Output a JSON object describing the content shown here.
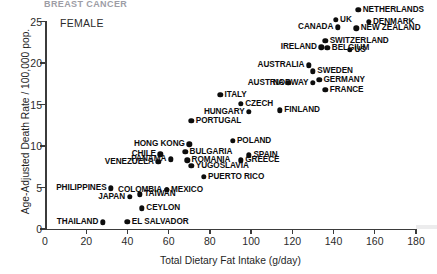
{
  "top_clipped_text": "BREAST CANCER",
  "annotation": "FEMALE",
  "chart_data": {
    "type": "scatter",
    "title": "",
    "xlabel": "Total Dietary Fat Intake (g/day)",
    "ylabel": "Age-Adjusted Death Rate / 100,000 pop.",
    "xlim": [
      0,
      180
    ],
    "ylim": [
      0,
      25
    ],
    "xticks": [
      0,
      20,
      40,
      60,
      80,
      100,
      120,
      140,
      160,
      180
    ],
    "yticks": [
      0,
      5,
      10,
      15,
      20,
      25
    ],
    "grid": false,
    "legend": "none",
    "marker_color": "#0d0d0d",
    "points": [
      {
        "label": "NETHERLANDS",
        "x": 152,
        "y": 26.4,
        "side": "r"
      },
      {
        "label": "UK",
        "x": 141,
        "y": 25.2,
        "side": "r"
      },
      {
        "label": "DENMARK",
        "x": 157,
        "y": 25.0,
        "side": "r"
      },
      {
        "label": "CANADA",
        "x": 142,
        "y": 24.3,
        "side": "l"
      },
      {
        "label": "NEW ZEALAND",
        "x": 151,
        "y": 24.2,
        "side": "r"
      },
      {
        "label": "SWITZERLAND",
        "x": 136,
        "y": 22.7,
        "side": "r"
      },
      {
        "label": "IRELAND",
        "x": 134,
        "y": 21.9,
        "side": "l"
      },
      {
        "label": "BELGIUM",
        "x": 137,
        "y": 21.8,
        "side": "r"
      },
      {
        "label": "US",
        "x": 148,
        "y": 21.6,
        "side": "r"
      },
      {
        "label": "AUSTRALIA",
        "x": 128,
        "y": 19.7,
        "side": "l"
      },
      {
        "label": "SWEDEN",
        "x": 130,
        "y": 19.0,
        "side": "r"
      },
      {
        "label": "GERMANY",
        "x": 133,
        "y": 18.0,
        "side": "r"
      },
      {
        "label": "AUSTRIA",
        "x": 118,
        "y": 17.6,
        "side": "l"
      },
      {
        "label": "NORWAY",
        "x": 130,
        "y": 17.6,
        "side": "l"
      },
      {
        "label": "FRANCE",
        "x": 136,
        "y": 16.8,
        "side": "r"
      },
      {
        "label": "ITALY",
        "x": 85,
        "y": 16.2,
        "side": "r"
      },
      {
        "label": "CZECH",
        "x": 95,
        "y": 15.1,
        "side": "r"
      },
      {
        "label": "HUNGARY",
        "x": 99,
        "y": 14.1,
        "side": "l"
      },
      {
        "label": "FINLAND",
        "x": 114,
        "y": 14.3,
        "side": "r"
      },
      {
        "label": "PORTUGAL",
        "x": 71,
        "y": 13.0,
        "side": "r"
      },
      {
        "label": "HONG KONG",
        "x": 70,
        "y": 10.2,
        "side": "l"
      },
      {
        "label": "POLAND",
        "x": 91,
        "y": 10.6,
        "side": "r"
      },
      {
        "label": "CHILE",
        "x": 56,
        "y": 9.0,
        "side": "l"
      },
      {
        "label": "BULGARIA",
        "x": 68,
        "y": 9.3,
        "side": "r"
      },
      {
        "label": "SPAIN",
        "x": 99,
        "y": 8.9,
        "side": "r"
      },
      {
        "label": "VENEZUELA",
        "x": 55,
        "y": 8.1,
        "side": "l"
      },
      {
        "label": "PANAMA",
        "x": 61,
        "y": 8.4,
        "side": "l"
      },
      {
        "label": "ROMANIA",
        "x": 69,
        "y": 8.3,
        "side": "r"
      },
      {
        "label": "GREECE",
        "x": 95,
        "y": 8.3,
        "side": "r"
      },
      {
        "label": "YUGOSLAVIA",
        "x": 71,
        "y": 7.6,
        "side": "r"
      },
      {
        "label": "PUERTO RICO",
        "x": 77,
        "y": 6.3,
        "side": "r"
      },
      {
        "label": "PHILIPPINES",
        "x": 32,
        "y": 4.9,
        "side": "l"
      },
      {
        "label": "COLOMBIA",
        "x": 59,
        "y": 4.7,
        "side": "l"
      },
      {
        "label": "MEXICO",
        "x": 59,
        "y": 4.7,
        "side": "r"
      },
      {
        "label": "JAPAN",
        "x": 41,
        "y": 3.9,
        "side": "l"
      },
      {
        "label": "TAIWAN",
        "x": 46,
        "y": 4.2,
        "side": "r"
      },
      {
        "label": "CEYLON",
        "x": 47,
        "y": 2.5,
        "side": "r"
      },
      {
        "label": "THAILAND",
        "x": 28,
        "y": 0.8,
        "side": "l"
      },
      {
        "label": "EL SALVADOR",
        "x": 40,
        "y": 0.9,
        "side": "r"
      }
    ]
  }
}
